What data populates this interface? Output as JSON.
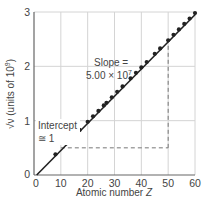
{
  "chart_data": {
    "type": "scatter",
    "title": "",
    "xlabel": "Atomic number Z",
    "ylabel": "√ν (units of 10⁹)",
    "ylabel_parts": {
      "root": "√ν",
      "rest": " (units of 10",
      "exp": "9",
      "close": ")"
    },
    "xlim": [
      0,
      60
    ],
    "ylim": [
      0,
      3
    ],
    "xticks": [
      0,
      10,
      20,
      30,
      40,
      50,
      60
    ],
    "yticks": [
      0,
      1,
      2,
      3
    ],
    "grid": true,
    "legend": null,
    "series": [
      {
        "name": "Moseley data",
        "x": [
          8,
          12,
          15,
          17,
          20,
          22,
          24,
          26,
          27,
          29,
          31,
          33,
          36,
          38,
          40,
          42,
          45,
          47,
          50,
          52,
          54,
          56,
          58,
          60
        ],
        "y": [
          0.38,
          0.58,
          0.73,
          0.83,
          0.98,
          1.08,
          1.18,
          1.28,
          1.33,
          1.43,
          1.53,
          1.63,
          1.78,
          1.88,
          1.98,
          2.08,
          2.23,
          2.33,
          2.48,
          2.58,
          2.68,
          2.78,
          2.88,
          2.98
        ]
      }
    ],
    "fit_line": {
      "x": [
        1,
        60
      ],
      "y": [
        0,
        2.95
      ],
      "slope_label": "5.00 × 10⁷",
      "intercept_label": "≅ 1"
    },
    "slope_triangle": {
      "x_start": 10,
      "x_end": 50,
      "y_low": 0.5,
      "y_high": 2.48
    },
    "annotations": [
      {
        "text": "Slope =",
        "x": 38,
        "y": 2.05
      },
      {
        "text": "5.00 × 10",
        "sup": "7",
        "x": 38,
        "y": 1.8
      },
      {
        "text": "Intercept",
        "x": 2,
        "y": 1.1
      },
      {
        "text": "≅ 1",
        "x": 2,
        "y": 0.85
      }
    ]
  },
  "labels": {
    "xlabel_text": "Atomic number ",
    "xlabel_var": "Z",
    "slope_line1": "Slope =",
    "slope_line2": "5.00 × 10",
    "slope_exp": "7",
    "intercept_line1": "Intercept",
    "intercept_line2": "≅ 1"
  }
}
